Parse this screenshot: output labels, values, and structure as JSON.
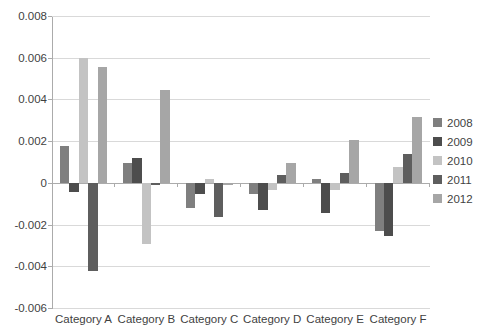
{
  "chart_data": {
    "type": "bar",
    "title": "",
    "xlabel": "",
    "ylabel": "",
    "categories": [
      "Category A",
      "Category B",
      "Category C",
      "Category D",
      "Category E",
      "Category F"
    ],
    "series": [
      {
        "name": "2008",
        "color": "#7f7f7f",
        "values": [
          0.0018,
          0.001,
          -0.0012,
          -0.0005,
          0.0002,
          -0.0023
        ]
      },
      {
        "name": "2009",
        "color": "#4d4d4d",
        "values": [
          -0.0004,
          0.0012,
          -0.0005,
          -0.0013,
          -0.0014,
          -0.0025
        ]
      },
      {
        "name": "2010",
        "color": "#c3c3c3",
        "values": [
          0.006,
          -0.0029,
          0.0002,
          -0.0003,
          -0.0003,
          0.0008
        ]
      },
      {
        "name": "2011",
        "color": "#5e5e5e",
        "values": [
          -0.0042,
          -0.0001,
          -0.0016,
          0.0004,
          0.0005,
          0.0014
        ]
      },
      {
        "name": "2012",
        "color": "#a6a6a6",
        "values": [
          0.0056,
          0.0045,
          -0.0001,
          0.001,
          0.0021,
          0.0032
        ]
      }
    ],
    "ylim": [
      -0.006,
      0.008
    ],
    "ytick_step": 0.002,
    "ytick_labels": [
      "0.008",
      "0.006",
      "0.004",
      "0.002",
      "0",
      "-0.002",
      "-0.004",
      "-0.006"
    ],
    "grid": true,
    "legend_position": "right",
    "colors": {
      "background": "#ffffff",
      "gridline": "#d9d9d9",
      "axis_line": "#ababab",
      "tick_mark": "#ababab",
      "label_text": "#3f3f3f"
    }
  }
}
